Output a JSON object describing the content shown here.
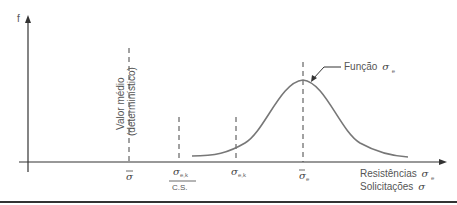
{
  "axes": {
    "y_label": "f",
    "x_label_line1": "Resistências",
    "x_label_line1_symbol": "σ",
    "x_label_line1_sub": "e",
    "x_label_line2": "Solicitações",
    "x_label_line2_symbol": "σ"
  },
  "annotations": {
    "mean_value_line1": "Valor médio",
    "mean_value_line2": "(determinístico)",
    "function_label": "Função",
    "function_symbol": "σ",
    "function_sub": "e"
  },
  "ticks": [
    {
      "symbol": "σ",
      "sub": "",
      "overbar": true
    },
    {
      "symbol": "σ",
      "sub": "e,k",
      "denominator": "C.S."
    },
    {
      "symbol": "σ",
      "sub": "e,k"
    },
    {
      "symbol": "σ",
      "sub": "e",
      "overbar": true
    }
  ],
  "colors": {
    "axis": "#333333",
    "curve": "#777777",
    "dashed": "#444444",
    "text": "#555555"
  }
}
